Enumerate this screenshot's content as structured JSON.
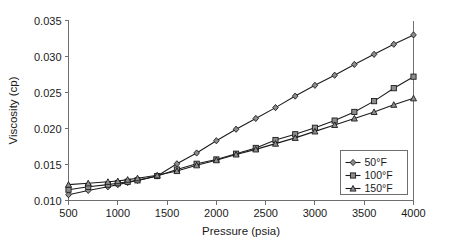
{
  "chart_data": {
    "type": "line",
    "title": "",
    "xlabel": "Pressure (psia)",
    "ylabel": "Viscosity (cp)",
    "xlim": [
      500,
      4000
    ],
    "ylim": [
      0.01,
      0.035
    ],
    "xticks": [
      500,
      1000,
      1500,
      2000,
      2500,
      3000,
      3500,
      4000
    ],
    "yticks": [
      0.01,
      0.015,
      0.02,
      0.025,
      0.03,
      0.035
    ],
    "xtick_labels": [
      "500",
      "1000",
      "1500",
      "2000",
      "2500",
      "3000",
      "3500",
      "4000"
    ],
    "ytick_labels": [
      "0.010",
      "0.015",
      "0.020",
      "0.025",
      "0.030",
      "0.035"
    ],
    "grid": false,
    "legend_position": "lower-right",
    "x": [
      500,
      700,
      900,
      1000,
      1100,
      1200,
      1400,
      1600,
      1800,
      2000,
      2200,
      2400,
      2600,
      2800,
      3000,
      3200,
      3400,
      3600,
      3800,
      4000
    ],
    "series": [
      {
        "name": "50°F",
        "marker": "diamond",
        "color": "#1c1c1c",
        "values": [
          0.0108,
          0.0114,
          0.0119,
          0.0122,
          0.0125,
          0.0128,
          0.0134,
          0.0151,
          0.0166,
          0.0183,
          0.0199,
          0.0214,
          0.0229,
          0.0245,
          0.026,
          0.0274,
          0.0289,
          0.0303,
          0.0317,
          0.033
        ]
      },
      {
        "name": "100°F",
        "marker": "square",
        "color": "#1c1c1c",
        "values": [
          0.0115,
          0.0119,
          0.0122,
          0.0124,
          0.0126,
          0.0128,
          0.0134,
          0.0143,
          0.0151,
          0.0157,
          0.0165,
          0.0173,
          0.0184,
          0.0192,
          0.0201,
          0.0211,
          0.0223,
          0.0238,
          0.0256,
          0.0272
        ]
      },
      {
        "name": "150°F",
        "marker": "triangle",
        "color": "#1c1c1c",
        "values": [
          0.0122,
          0.0124,
          0.0126,
          0.0127,
          0.0129,
          0.0131,
          0.0135,
          0.0141,
          0.0149,
          0.0156,
          0.0164,
          0.0171,
          0.0179,
          0.0187,
          0.0196,
          0.0205,
          0.0214,
          0.0223,
          0.0233,
          0.0242
        ]
      }
    ]
  },
  "legend": {
    "items": [
      {
        "label": "50°F"
      },
      {
        "label": "100°F"
      },
      {
        "label": "150°F"
      }
    ]
  }
}
